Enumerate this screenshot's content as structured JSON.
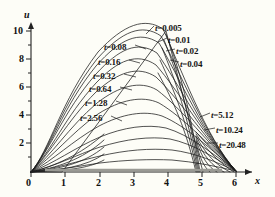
{
  "figure": {
    "background_color": "#fdfdf7",
    "curve_color": "#1a1a1a",
    "axis_color": "#222222"
  },
  "axes": {
    "x_name": "x",
    "y_name": "u",
    "x_ticks": [
      "0",
      "1",
      "2",
      "3",
      "4",
      "5",
      "6"
    ],
    "y_ticks": [
      "0",
      "2",
      "4",
      "6",
      "8",
      "10"
    ],
    "origin_label": "0"
  },
  "labels": [
    {
      "id": "t-0.005",
      "t": "t",
      "eq": "=",
      "value": "0.005",
      "x": 155,
      "y": 24
    },
    {
      "id": "t-0.01",
      "t": "t",
      "eq": "=",
      "value": "0.01",
      "x": 168,
      "y": 36
    },
    {
      "id": "t-0.02",
      "t": "t",
      "eq": "=",
      "value": "0.02",
      "x": 176,
      "y": 47
    },
    {
      "id": "t-0.04",
      "t": "t",
      "eq": "=",
      "value": "0.04",
      "x": 180,
      "y": 60
    },
    {
      "id": "t-0.08",
      "t": "t",
      "eq": "=",
      "value": "0.08",
      "x": 104,
      "y": 43
    },
    {
      "id": "t-0.16",
      "t": "t",
      "eq": "=",
      "value": "0.16",
      "x": 98,
      "y": 58
    },
    {
      "id": "t-0.32",
      "t": "t",
      "eq": "=",
      "value": "0.32",
      "x": 93,
      "y": 72
    },
    {
      "id": "t-0.64",
      "t": "t",
      "eq": "=",
      "value": "0.64",
      "x": 89,
      "y": 85
    },
    {
      "id": "t-1.28",
      "t": "t",
      "eq": "=",
      "value": "1.28",
      "x": 85,
      "y": 99
    },
    {
      "id": "t-2.56",
      "t": "t",
      "eq": "=",
      "value": "2.56",
      "x": 80,
      "y": 114
    },
    {
      "id": "t-5.12",
      "t": "t",
      "eq": "=",
      "value": "5.12",
      "x": 211,
      "y": 111
    },
    {
      "id": "t-10.24",
      "t": "t",
      "eq": "=",
      "value": "10.24",
      "x": 216,
      "y": 126
    },
    {
      "id": "t-20.48",
      "t": "t",
      "eq": "=",
      "value": "20.48",
      "x": 219,
      "y": 141
    }
  ],
  "chart_data": {
    "type": "line",
    "title": "",
    "xlabel": "x",
    "ylabel": "u",
    "xlim": [
      0,
      6.2
    ],
    "ylim": [
      0,
      11
    ],
    "grid": false,
    "legend": "inline-annotations",
    "series": [
      {
        "name": "t = 0.005",
        "peak_x": 4.0,
        "peak_u": 10.0
      },
      {
        "name": "t = 0.01",
        "peak_x": 4.0,
        "peak_u": 9.5
      },
      {
        "name": "t = 0.02",
        "peak_x": 4.0,
        "peak_u": 9.0
      },
      {
        "name": "t = 0.04",
        "peak_x": 4.0,
        "peak_u": 8.4
      },
      {
        "name": "t = 0.08",
        "peak_x": 3.95,
        "peak_u": 7.7
      },
      {
        "name": "t = 0.16",
        "peak_x": 3.9,
        "peak_u": 6.9
      },
      {
        "name": "t = 0.32",
        "peak_x": 3.85,
        "peak_u": 6.1
      },
      {
        "name": "t = 0.64",
        "peak_x": 3.8,
        "peak_u": 5.2
      },
      {
        "name": "t = 1.28",
        "peak_x": 3.75,
        "peak_u": 4.3
      },
      {
        "name": "t = 2.56",
        "peak_x": 3.7,
        "peak_u": 3.5
      },
      {
        "name": "t = 5.12",
        "peak_x": 3.6,
        "peak_u": 2.7
      },
      {
        "name": "t = 10.24",
        "peak_x": 3.5,
        "peak_u": 2.0
      },
      {
        "name": "t = 20.48",
        "peak_x": 3.4,
        "peak_u": 1.2
      }
    ],
    "nodes": [
      {
        "x": 2.3,
        "u": 3.1
      },
      {
        "x": 4.7,
        "u": 3.1
      }
    ]
  }
}
